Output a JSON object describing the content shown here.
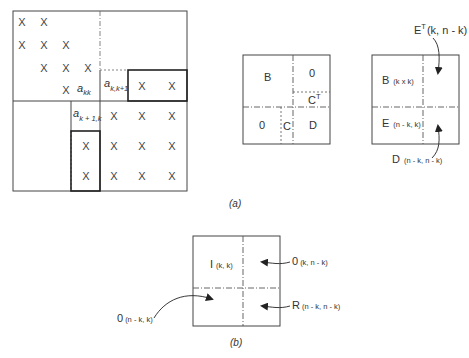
{
  "figure": {
    "captions": {
      "a": "(a)",
      "b": "(b)"
    },
    "matrix_a": {
      "mark": "X",
      "elements": {
        "akk_main": "a",
        "akk_sub": "kk",
        "akk1_main": "a",
        "akk1_sub": "k,k+1",
        "ak1k_main": "a",
        "ak1k_sub": "k + 1,k"
      },
      "marks_positions": [
        [
          22,
          22
        ],
        [
          44,
          22
        ],
        [
          22,
          45
        ],
        [
          44,
          45
        ],
        [
          66,
          45
        ],
        [
          44,
          68
        ],
        [
          66,
          68
        ],
        [
          88,
          68
        ],
        [
          66,
          90
        ],
        [
          142,
          86
        ],
        [
          172,
          86
        ],
        [
          114,
          116
        ],
        [
          142,
          116
        ],
        [
          172,
          116
        ],
        [
          86,
          146
        ],
        [
          114,
          146
        ],
        [
          142,
          146
        ],
        [
          172,
          146
        ],
        [
          86,
          176
        ],
        [
          114,
          176
        ],
        [
          142,
          176
        ],
        [
          172,
          176
        ]
      ]
    },
    "partition_mid": {
      "B": "B",
      "zero_top": "0",
      "CT_main": "C",
      "CT_sup": "T",
      "zero_bottom": "0",
      "C": "C",
      "D": "D"
    },
    "partition_right": {
      "ET_main": "E",
      "ET_sup": "T",
      "ET_dim": "(k, n - k)",
      "B_main": "B",
      "B_dim": "(k x k)",
      "E_main": "E",
      "E_dim": "(n - k, k)",
      "D_main": "D",
      "D_dim": "(n - k, n - k)"
    },
    "partition_b": {
      "I_main": "I",
      "I_dim": "(k, k)",
      "zero_tr_main": "0",
      "zero_tr_dim": "(k, n - k)",
      "R_main": "R",
      "R_dim": "(n - k, n - k)",
      "zero_bl_main": "0",
      "zero_bl_dim": "(n - k, k)"
    }
  }
}
